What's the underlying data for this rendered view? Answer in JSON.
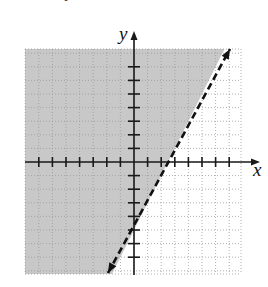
{
  "chart_data": {
    "type": "line",
    "title": "",
    "xlabel": "x",
    "ylabel": "y",
    "xlim": [
      -8,
      8
    ],
    "ylim": [
      -8,
      8
    ],
    "grid": true,
    "grid_style": "dotted",
    "x_ticks": [
      -7,
      -6,
      -5,
      -4,
      -3,
      -2,
      -1,
      1,
      2,
      3,
      4,
      5,
      6,
      7
    ],
    "y_ticks": [
      -7,
      -6,
      -5,
      -4,
      -3,
      -2,
      -1,
      1,
      2,
      3,
      4,
      5,
      6,
      7
    ],
    "tick_labels_shown": false,
    "series": [
      {
        "name": "boundary",
        "equation": "y = 2x - 5",
        "slope": 2,
        "intercept": -5,
        "style": "dashed",
        "arrows": "both",
        "x": [
          -1.9,
          7.0
        ],
        "y": [
          -8.3,
          8.3
        ]
      }
    ],
    "shaded_region": {
      "inequality": "y > 2x - 5",
      "side": "left/above line",
      "color": "#c8c8c8"
    }
  },
  "labels": {
    "x_axis": "x",
    "y_axis": "y",
    "top_fragment": "y"
  },
  "colors": {
    "shade": "#c8c8c8",
    "axis": "#1a1a1a",
    "grid": "#9a9a9a",
    "line": "#111111"
  }
}
